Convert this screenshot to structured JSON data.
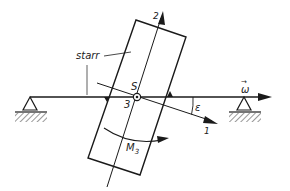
{
  "diagram": {
    "labels": {
      "starr": "starr",
      "S": "S",
      "axis1": "1",
      "axis2": "2",
      "axis3": "3",
      "epsilon": "ε",
      "omega": "ω",
      "omega_vec": "→",
      "M3": "M",
      "M3_sub": "3"
    },
    "colors": {
      "ink": "#1a1a1a",
      "background": "#ffffff"
    }
  }
}
